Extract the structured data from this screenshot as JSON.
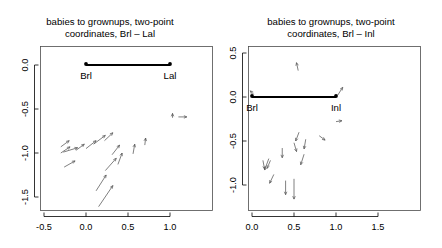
{
  "figure": {
    "kind": "two-panel-scatter-vector-plot",
    "background": "#ffffff",
    "width": 442,
    "height": 248
  },
  "chart_data": [
    {
      "type": "scatter",
      "panel": "left",
      "title": "babies to grownups, two-point coordinates, Brl – Lal",
      "title_line1": "babies to grownups, two-point",
      "title_line2": "coordinates, Brl – Lal",
      "xlabel": "",
      "ylabel": "",
      "xlim": [
        -0.72,
        1.32
      ],
      "ylim": [
        -1.78,
        0.28
      ],
      "xticks": [
        -0.5,
        0.0,
        0.5,
        1.0
      ],
      "xticklabels": [
        "-0.5",
        "0.0",
        "0.5",
        "1.0"
      ],
      "yticks": [
        0.0,
        -0.5,
        -1.0,
        -1.5
      ],
      "yticklabels": [
        "0.0",
        "-0.5",
        "-1.0",
        "-1.5"
      ],
      "grid": false,
      "legend": false,
      "baseline": {
        "points": [
          {
            "label": "Brl",
            "x": 0.0,
            "y": 0.0
          },
          {
            "label": "Lal",
            "x": 1.0,
            "y": 0.0
          }
        ],
        "color": "#000000"
      },
      "vectors": [
        {
          "x": -0.3,
          "y": -0.93,
          "dx": 0.1,
          "dy": 0.07
        },
        {
          "x": -0.3,
          "y": -1.0,
          "dx": 0.11,
          "dy": 0.07
        },
        {
          "x": -0.27,
          "y": -0.99,
          "dx": 0.17,
          "dy": 0.05
        },
        {
          "x": -0.26,
          "y": -1.16,
          "dx": 0.13,
          "dy": 0.07
        },
        {
          "x": -0.12,
          "y": -0.97,
          "dx": 0.1,
          "dy": 0.07
        },
        {
          "x": 0.0,
          "y": -0.95,
          "dx": 0.12,
          "dy": 0.09
        },
        {
          "x": 0.09,
          "y": -0.9,
          "dx": 0.14,
          "dy": 0.1
        },
        {
          "x": 0.12,
          "y": -1.43,
          "dx": 0.12,
          "dy": 0.18
        },
        {
          "x": 0.15,
          "y": -1.61,
          "dx": 0.17,
          "dy": 0.24
        },
        {
          "x": 0.22,
          "y": -0.86,
          "dx": 0.1,
          "dy": 0.09
        },
        {
          "x": 0.23,
          "y": -1.2,
          "dx": 0.13,
          "dy": 0.14
        },
        {
          "x": 0.31,
          "y": -1.02,
          "dx": 0.09,
          "dy": 0.11
        },
        {
          "x": 0.38,
          "y": -1.13,
          "dx": 0.05,
          "dy": 0.13
        },
        {
          "x": 0.56,
          "y": -1.01,
          "dx": 0.02,
          "dy": 0.11
        },
        {
          "x": 0.7,
          "y": -0.91,
          "dx": 0.01,
          "dy": 0.08
        },
        {
          "x": 1.03,
          "y": -0.6,
          "dx": 0.0,
          "dy": 0.05
        },
        {
          "x": 1.1,
          "y": -0.59,
          "dx": 0.1,
          "dy": 0.0
        }
      ]
    },
    {
      "type": "scatter",
      "panel": "right",
      "title": "babies to grownups, two-point coordinates, Brl – Inl",
      "title_line1": "babies to grownups, two-point",
      "title_line2": "coordinates, Brl – Inl",
      "xlabel": "",
      "ylabel": "",
      "xlim": [
        -0.22,
        1.82
      ],
      "ylim": [
        -1.28,
        0.78
      ],
      "xticks": [
        0.0,
        0.5,
        1.0,
        1.5
      ],
      "xticklabels": [
        "0.0",
        "0.5",
        "1.0",
        "1.5"
      ],
      "yticks": [
        0.5,
        0.0,
        -0.5,
        -1.0
      ],
      "yticklabels": [
        "0.5",
        "0.0",
        "-0.5",
        "-1.0"
      ],
      "grid": false,
      "legend": false,
      "baseline": {
        "points": [
          {
            "label": "Brl",
            "x": 0.0,
            "y": 0.0
          },
          {
            "label": "Inl",
            "x": 1.0,
            "y": 0.0
          }
        ],
        "color": "#000000"
      },
      "vectors": [
        {
          "x": 0.55,
          "y": 0.3,
          "dx": -0.02,
          "dy": 0.09
        },
        {
          "x": 1.02,
          "y": 0.02,
          "dx": 0.06,
          "dy": 0.09
        },
        {
          "x": 0.02,
          "y": 0.03,
          "dx": -0.04,
          "dy": 0.04
        },
        {
          "x": 1.0,
          "y": -0.28,
          "dx": 0.07,
          "dy": 0.01
        },
        {
          "x": 0.56,
          "y": -0.4,
          "dx": -0.04,
          "dy": -0.1
        },
        {
          "x": 0.5,
          "y": -0.52,
          "dx": 0.03,
          "dy": -0.1
        },
        {
          "x": 0.64,
          "y": -0.48,
          "dx": -0.02,
          "dy": -0.11
        },
        {
          "x": 0.8,
          "y": -0.44,
          "dx": 0.07,
          "dy": -0.05
        },
        {
          "x": 0.36,
          "y": -0.58,
          "dx": 0.0,
          "dy": -0.11
        },
        {
          "x": 0.13,
          "y": -0.72,
          "dx": 0.02,
          "dy": -0.1
        },
        {
          "x": 0.2,
          "y": -0.7,
          "dx": -0.05,
          "dy": -0.13
        },
        {
          "x": 0.22,
          "y": -0.72,
          "dx": -0.04,
          "dy": -0.09
        },
        {
          "x": 0.62,
          "y": -0.65,
          "dx": -0.04,
          "dy": -0.12
        },
        {
          "x": 0.26,
          "y": -0.88,
          "dx": -0.05,
          "dy": -0.1
        },
        {
          "x": 0.4,
          "y": -0.95,
          "dx": 0.0,
          "dy": -0.16
        },
        {
          "x": 0.5,
          "y": -0.93,
          "dx": 0.0,
          "dy": -0.23
        }
      ]
    }
  ]
}
